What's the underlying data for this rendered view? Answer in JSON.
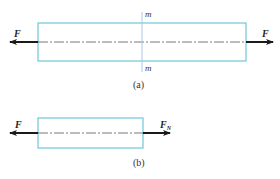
{
  "colors": {
    "bar_outline": "#6fc9d8",
    "section_line": "#a9c8e0",
    "arrow": "#1a1a1a",
    "axis_line": "#555555",
    "text": "#222222"
  },
  "figure_a": {
    "caption": "(a)",
    "left_force_label": "F",
    "right_force_label": "F",
    "section_label_top": "m",
    "section_label_bottom": "m"
  },
  "figure_b": {
    "caption": "(b)",
    "left_force_label": "F",
    "right_force_label": "F",
    "right_force_subscript": "N"
  }
}
